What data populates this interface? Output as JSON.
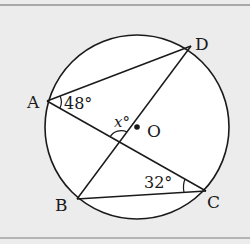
{
  "figure": {
    "background": "#ececec",
    "line_color": "#1a1a1a",
    "circle": {
      "center_label": "O",
      "cx": 137,
      "cy": 127,
      "r": 92
    },
    "points": {
      "A": {
        "label": "A",
        "x": 47,
        "y": 101
      },
      "D": {
        "label": "D",
        "x": 191,
        "y": 46
      },
      "B": {
        "label": "B",
        "x": 77,
        "y": 199
      },
      "C": {
        "label": "C",
        "x": 206,
        "y": 191
      },
      "O": {
        "label": "O",
        "x": 137,
        "y": 127
      }
    },
    "segments": [
      "AD",
      "AC",
      "BD",
      "BC"
    ],
    "angles": {
      "angle_DAC": {
        "label": "48°",
        "value": 48,
        "vertex": "A"
      },
      "angle_ACB": {
        "label": "32°",
        "value": 32,
        "vertex": "C"
      },
      "angle_x": {
        "label": "x°",
        "variable": "x",
        "vertex": "intersection of AC and BD"
      }
    }
  }
}
